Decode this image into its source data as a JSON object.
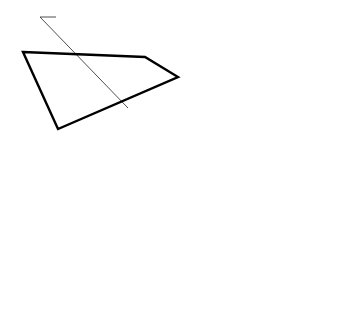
{
  "diagram": {
    "title_annotations": {
      "top": "Major axis in top view",
      "bottom": "Major axis in front view"
    },
    "reference_lines": {
      "hf_top": "H",
      "hf_bottom": "F",
      "h2_h": "H",
      "h2_2": "2",
      "f1_f": "F",
      "f1_1": "1"
    },
    "top_view": {
      "corner_f_left": "f",
      "corner_f_right": "f",
      "corner_h_left": "h",
      "corner_h_right": "h",
      "x_upper": "x",
      "x_lower": "x",
      "y_left": "y",
      "y_right": "y",
      "center": "o",
      "center_sup": "H",
      "true_length": "TL"
    },
    "aux_view_2": {
      "x_top": "x",
      "x_bottom": "x",
      "center": "o",
      "center_sub": "2",
      "edge_view": "EV",
      "diameter": "Dia",
      "d1": "D",
      "d1_sub": "1"
    },
    "front_view": {
      "corner_f_left": "f",
      "corner_f_right": "f",
      "corner_h_left": "h",
      "corner_h_right": "h",
      "n_top": "n",
      "n_bottom": "n",
      "s_left": "s",
      "s_right": "s",
      "center": "o",
      "center_sup": "F",
      "true_length": "TL",
      "d1": "D",
      "d1_sub": "1",
      "d_small": "D"
    },
    "aux_view_1": {
      "n_left": "n",
      "n_right": "n",
      "center": "o",
      "center_sup": "1",
      "edge_view": "EV",
      "diameter": "Dia",
      "d_small": "D"
    }
  }
}
